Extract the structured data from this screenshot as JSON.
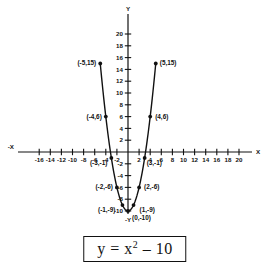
{
  "figure": {
    "title": "",
    "equation_box": {
      "y": "y",
      "equals": "=",
      "base": "x",
      "exponent": "2",
      "rest": "– 10",
      "plain": "y = x2 - 10"
    },
    "axis_names": {
      "x_positive": "X",
      "x_negative": "-X",
      "y_positive": "Y",
      "y_negative": "-Y"
    }
  },
  "chart_data": {
    "type": "scatter",
    "xlabel": "X",
    "ylabel": "Y",
    "grid": false,
    "legend": "none",
    "xlim": [
      -20,
      22
    ],
    "ylim": [
      -12,
      22
    ],
    "x_ticks": [
      -16,
      -14,
      -12,
      -10,
      -8,
      -6,
      -4,
      -2,
      2,
      4,
      6,
      8,
      10,
      12,
      14,
      16,
      18,
      20
    ],
    "x_tick_labels": [
      "-16",
      "-14",
      "-12",
      "-10",
      "-8",
      "-6",
      "-4",
      "-2",
      "2",
      "4",
      "6",
      "8",
      "10",
      "12",
      "14",
      "16",
      "18",
      "20"
    ],
    "y_ticks": [
      20,
      18,
      16,
      14,
      12,
      10,
      8,
      6,
      4,
      2,
      -2,
      -4,
      -6,
      -8,
      -10
    ],
    "y_tick_labels": [
      "20",
      "18",
      "16",
      "14",
      "12",
      "10",
      "8",
      "6",
      "4",
      "2",
      "-2",
      "-4",
      "-6",
      "-8",
      "-10"
    ],
    "x": [
      -5,
      -4,
      -3,
      -2,
      -1,
      0,
      1,
      2,
      3,
      4,
      5
    ],
    "values": [
      15,
      6,
      -1,
      -6,
      -9,
      -10,
      -9,
      -6,
      -1,
      6,
      15
    ],
    "point_labels": [
      "(-5,15)",
      "(-4,6)",
      "(-3,-1)",
      "(-2,-6)",
      "(-1,-9)",
      "(0,-10)",
      "(1,-9)",
      "(2,-6)",
      "(3,-1)",
      "(4,6)",
      "(5,15)"
    ]
  }
}
